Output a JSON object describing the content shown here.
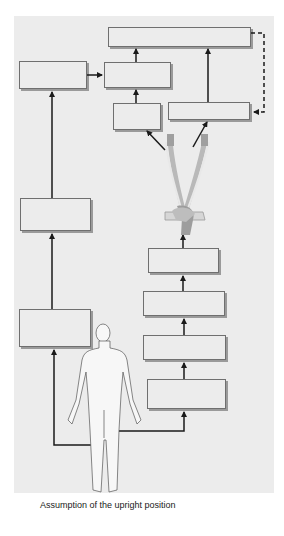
{
  "diagram": {
    "caption": "Assumption of the upright position",
    "background_color": "#ececec",
    "box_border_color": "#6f6f6f",
    "arrow_color": "#1a1a1a",
    "boxes": [
      {
        "id": "box-top-wide",
        "label": "",
        "x": 108,
        "y": 27,
        "w": 143,
        "h": 20
      },
      {
        "id": "box-left-top",
        "label": "",
        "x": 19,
        "y": 61,
        "w": 68,
        "h": 28
      },
      {
        "id": "box-center-top",
        "label": "",
        "x": 104,
        "y": 62,
        "w": 67,
        "h": 26
      },
      {
        "id": "box-center-small",
        "label": "",
        "x": 113,
        "y": 103,
        "w": 48,
        "h": 27
      },
      {
        "id": "box-right-mid",
        "label": "",
        "x": 168,
        "y": 102,
        "w": 82,
        "h": 18
      },
      {
        "id": "box-left-mid",
        "label": "",
        "x": 20,
        "y": 198,
        "w": 71,
        "h": 33
      },
      {
        "id": "box-left-lower",
        "label": "",
        "x": 19,
        "y": 309,
        "w": 72,
        "h": 38
      },
      {
        "id": "box-right-stack-1",
        "label": "",
        "x": 148,
        "y": 248,
        "w": 71,
        "h": 25
      },
      {
        "id": "box-right-stack-2",
        "label": "",
        "x": 143,
        "y": 291,
        "w": 82,
        "h": 25
      },
      {
        "id": "box-right-stack-3",
        "label": "",
        "x": 143,
        "y": 335,
        "w": 83,
        "h": 25
      },
      {
        "id": "box-right-stack-4",
        "label": "",
        "x": 147,
        "y": 379,
        "w": 79,
        "h": 30
      }
    ],
    "figures": {
      "human_body": "standing-human-figure",
      "vasculature": "carotid-aortic-baroreceptor-illustration"
    }
  }
}
